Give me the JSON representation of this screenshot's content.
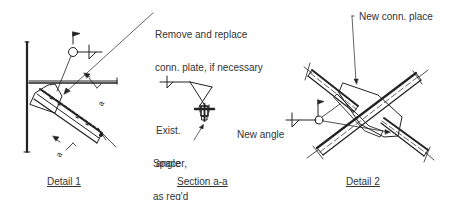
{
  "figure": {
    "type": "structural-connection-detail-drawing",
    "colors": {
      "ink": "#222222",
      "text": "#333333",
      "background": "#ffffff"
    }
  },
  "callouts": {
    "remove_replace": {
      "line1": "Remove and replace",
      "line2": "conn. plate, if necessary"
    },
    "new_conn_place": "New conn. place",
    "new_angle": "New angle",
    "exist_angle": {
      "line1": "Exist.",
      "line2": "angle"
    },
    "spacer": {
      "line1": "Spacer,",
      "line2": "as req'd"
    }
  },
  "section_markers": {
    "letter": "a"
  },
  "captions": {
    "detail1": "Detail 1",
    "section": "Section a-a",
    "detail2": "Detail 2"
  }
}
